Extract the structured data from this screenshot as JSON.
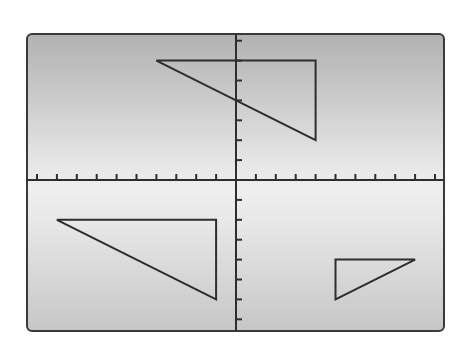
{
  "chart_data": {
    "type": "diagram",
    "title": "",
    "axes": {
      "x_ticks_left": 10,
      "x_ticks_right": 10,
      "y_ticks_up": 7,
      "y_ticks_down": 7,
      "tick_unit": 1,
      "xlim": [
        -10,
        10
      ],
      "ylim": [
        -7,
        7
      ],
      "grid": false,
      "tick_labels": false
    },
    "shapes": [
      {
        "name": "triangle-top",
        "type": "polygon",
        "vertices": [
          [
            -4,
            6
          ],
          [
            4,
            6
          ],
          [
            4,
            2
          ]
        ]
      },
      {
        "name": "triangle-bottom-left",
        "type": "polygon",
        "vertices": [
          [
            -9,
            -2
          ],
          [
            -1,
            -2
          ],
          [
            -1,
            -6
          ]
        ]
      },
      {
        "name": "triangle-bottom-right",
        "type": "polygon",
        "vertices": [
          [
            5,
            -4
          ],
          [
            9,
            -4
          ],
          [
            5,
            -6
          ]
        ]
      }
    ],
    "colors": {
      "stroke": "#2e2e2e",
      "frame": "#3a3a3a",
      "background_top": "#b2b2b2",
      "background_mid": "#efefef",
      "background_bottom": "#c6c6c6"
    }
  },
  "layout": {
    "origin_px": [
      236,
      180
    ],
    "unit_px": 19.9,
    "frame": {
      "left": 26,
      "top": 33,
      "right": 445,
      "bottom": 332
    }
  }
}
